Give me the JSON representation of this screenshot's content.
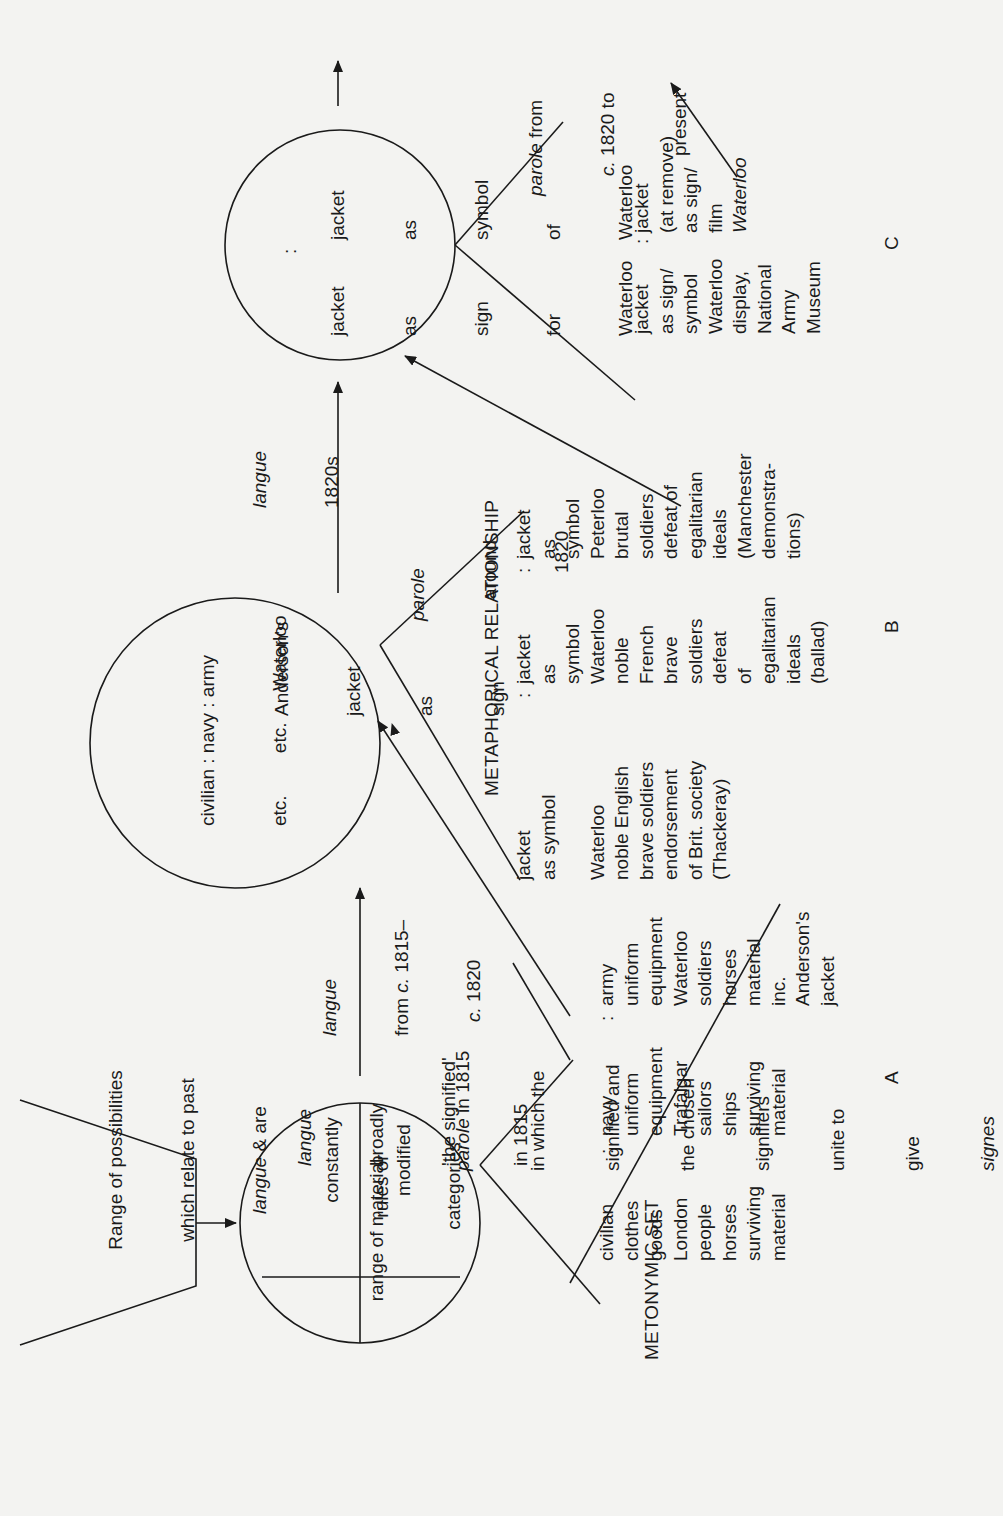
{
  "hexagon": {
    "lines": [
      "Range of possibilities",
      "which relate to past",
      "langue & are",
      "constantly",
      "modified"
    ]
  },
  "circle1": {
    "top_right": [
      "rules or",
      "categories"
    ],
    "bottom_left": "range of material"
  },
  "langue_1815": [
    "langue",
    "broadly",
    "'the signified'",
    "in 1815"
  ],
  "parole_1815": [
    "parole in 1815",
    "in which the",
    "signified and",
    "the chosen",
    "signifiers",
    "unite to",
    "give",
    "signes"
  ],
  "metonymic": {
    "label": "METONYMIC SET",
    "civilian": [
      "civilian",
      "clothes",
      "goods",
      "London",
      "people",
      "horses",
      "surviving",
      "material"
    ],
    "navy": [
      "navy",
      "uniform",
      "equipment",
      "Trafalgar",
      "sailors",
      "ships",
      "surviving",
      "material"
    ],
    "army": [
      "army",
      "uniform",
      "equipment",
      "Waterloo",
      "soldiers",
      "horses",
      "material",
      "inc.",
      "Anderson's",
      "jacket"
    ],
    "section": "A"
  },
  "langue_1815_1820": [
    "langue",
    "from c. 1815–",
    "c. 1820"
  ],
  "circle2": {
    "row1": [
      "civilian : navy : army",
      "etc.        etc.      Waterloo"
    ],
    "center": [
      "Anderson's",
      "jacket",
      "as",
      "sign"
    ]
  },
  "parole_1820": [
    "parole",
    "around",
    "1820"
  ],
  "langue_1820s": [
    "langue",
    "1820s"
  ],
  "metaphorical": {
    "label": "METAPHORICAL RELATIONSHIP",
    "col1": [
      "jacket",
      "as symbol",
      "",
      "Waterloo",
      "noble English",
      "brave soldiers",
      "endorsement",
      "of Brit. society",
      "(Thackeray)"
    ],
    "col2": [
      "jacket",
      "as",
      "symbol",
      "Waterloo",
      "noble",
      "French",
      "brave",
      "soldiers",
      "defeat",
      "of",
      "egalitarian",
      "ideals",
      "(ballad)"
    ],
    "col3": [
      "jacket",
      "as",
      "symbol",
      "Peterloo",
      "brutal",
      "soldiers",
      "defeat of",
      "egalitarian",
      "ideals",
      "(Manchester",
      "demonstra-",
      "tions)"
    ],
    "section": "B"
  },
  "circle3": {
    "left": [
      "jacket",
      "as",
      "sign",
      "for",
      "Waterloo"
    ],
    "right": [
      "jacket",
      "as",
      "symbol",
      "of",
      "Waterloo"
    ]
  },
  "parole_present": [
    "parole from",
    "c. 1820 to",
    "present"
  ],
  "section_c": {
    "col1": [
      "jacket",
      "as sign/",
      "symbol",
      "Waterloo",
      "display,",
      "National",
      "Army",
      "Museum"
    ],
    "col2": [
      "jacket",
      "(at remove)",
      "as sign/",
      "film",
      "Waterloo"
    ],
    "section": "C"
  },
  "separator": ":"
}
